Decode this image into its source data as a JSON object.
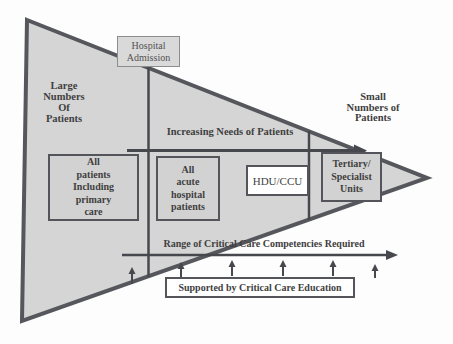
{
  "labels": {
    "hospital_admission": "Hospital\nAdmission",
    "large_numbers": "Large\nNumbers\nOf\nPatients",
    "small_numbers": "Small\nNumbers of\nPatients",
    "increasing_needs": "Increasing Needs of Patients",
    "range_competencies": "Range of Critical Care Competencies Required",
    "supported_by": "Supported by Critical Care Education"
  },
  "patient_boxes": [
    {
      "label": "All\npatients\nIncluding\nprimary\ncare",
      "fill": "gray"
    },
    {
      "label": "All\nacute\nhospital\npatients",
      "fill": "gray"
    },
    {
      "label": "HDU/CCU",
      "fill": "white"
    },
    {
      "label": "Tertiary/\nSpecialist\nUnits",
      "fill": "gray"
    }
  ],
  "education_arrow_count": 6,
  "colors": {
    "triangle_fill": "#d5d5d5",
    "triangle_border": "#55575c",
    "line_color": "#46484d",
    "box_fill": "#d2d2d2",
    "box_border": "#53555a",
    "white_box_fill": "#ffffff",
    "admission_box_fill": "#d9d9d9",
    "admission_box_border": "#8d8d8d",
    "text_color": "#3f3f3f"
  }
}
